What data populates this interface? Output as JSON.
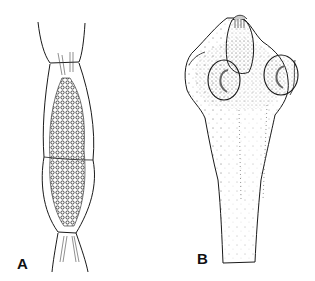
{
  "figure": {
    "panels": [
      {
        "id": "A",
        "label": "A",
        "subject": "proglottid segment with granular contents"
      },
      {
        "id": "B",
        "label": "B",
        "subject": "scolex with two suckers and apical rostellum"
      }
    ],
    "colors": {
      "ink": "#1a1a1a",
      "background": "#ffffff",
      "stipple": "#555555"
    }
  }
}
